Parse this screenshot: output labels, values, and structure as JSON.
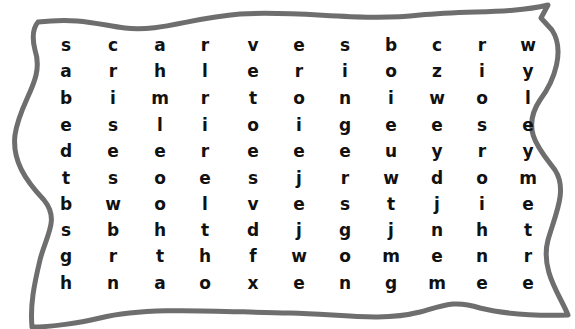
{
  "puzzle": {
    "type": "word-search",
    "rows": 10,
    "cols": 11,
    "border_color": "#6e6e6e",
    "letter_color": "#111111",
    "grid": [
      [
        "s",
        "c",
        "a",
        "r",
        "v",
        "e",
        "s",
        "b",
        "c",
        "r",
        "w"
      ],
      [
        "a",
        "r",
        "h",
        "l",
        "e",
        "r",
        "i",
        "o",
        "z",
        "i",
        "y"
      ],
      [
        "b",
        "i",
        "m",
        "r",
        "t",
        "o",
        "n",
        "i",
        "w",
        "o",
        "l"
      ],
      [
        "e",
        "s",
        "l",
        "i",
        "o",
        "i",
        "g",
        "e",
        "e",
        "s",
        "e"
      ],
      [
        "d",
        "e",
        "e",
        "r",
        "e",
        "e",
        "e",
        "u",
        "y",
        "r",
        "y"
      ],
      [
        "t",
        "s",
        "o",
        "e",
        "s",
        "j",
        "r",
        "w",
        "d",
        "o",
        "m"
      ],
      [
        "b",
        "w",
        "o",
        "l",
        "v",
        "e",
        "s",
        "t",
        "j",
        "i",
        "e"
      ],
      [
        "s",
        "b",
        "h",
        "t",
        "d",
        "j",
        "g",
        "j",
        "n",
        "h",
        "t"
      ],
      [
        "g",
        "r",
        "t",
        "h",
        "f",
        "w",
        "o",
        "m",
        "e",
        "n",
        "r"
      ],
      [
        "h",
        "n",
        "a",
        "o",
        "x",
        "e",
        "n",
        "g",
        "m",
        "e",
        "e"
      ]
    ]
  }
}
